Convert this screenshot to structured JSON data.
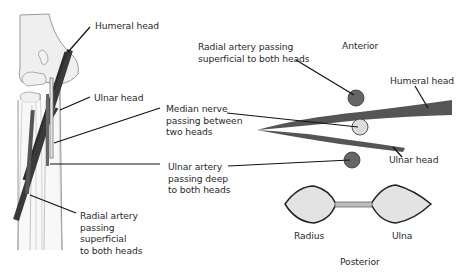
{
  "figure": {
    "title": "",
    "colors": {
      "muscle": "#555555",
      "artery": "#666666",
      "nerve": "#dcdcdc",
      "bone_fill": "#e6e6e6",
      "outline": "#222222",
      "leader": "#111111",
      "text": "#2a2a2a"
    }
  },
  "left_panel": {
    "labels": {
      "humeral_head": "Humeral head",
      "ulnar_head": "Ulnar head",
      "radial_artery": "Radial artery\npassing\nsuperficial\nto both heads"
    }
  },
  "right_panel": {
    "orientation": {
      "anterior": "Anterior",
      "posterior": "Posterior"
    },
    "labels": {
      "radial_artery": "Radial artery passing\nsuperficial to both heads",
      "median_nerve": "Median nerve\npassing between\ntwo heads",
      "ulnar_artery": "Ulnar artery\npassing deep\nto both heads",
      "humeral_head": "Humeral head",
      "ulnar_head": "Ulnar head",
      "radius": "Radius",
      "ulna": "Ulna"
    }
  }
}
